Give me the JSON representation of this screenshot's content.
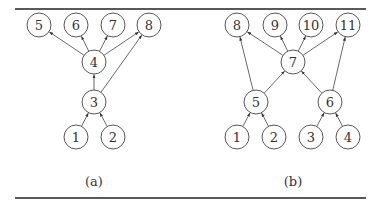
{
  "figure": {
    "rules": {
      "top_y": 9,
      "bottom_y": 198,
      "x1": 15,
      "x2": 366
    },
    "node_radius": 12,
    "panels": [
      {
        "id": "a",
        "caption": "(a)",
        "caption_pos": [
          94,
          186
        ],
        "nodes": [
          {
            "id": "5",
            "label": "5",
            "x": 39,
            "y": 25
          },
          {
            "id": "6",
            "label": "6",
            "x": 76,
            "y": 25
          },
          {
            "id": "7",
            "label": "7",
            "x": 113,
            "y": 25
          },
          {
            "id": "8",
            "label": "8",
            "x": 149,
            "y": 25
          },
          {
            "id": "4",
            "label": "4",
            "x": 94,
            "y": 62
          },
          {
            "id": "3",
            "label": "3",
            "x": 94,
            "y": 102
          },
          {
            "id": "1",
            "label": "1",
            "x": 76,
            "y": 137
          },
          {
            "id": "2",
            "label": "2",
            "x": 113,
            "y": 137
          }
        ],
        "edges": [
          {
            "from": "1",
            "to": "3"
          },
          {
            "from": "2",
            "to": "3"
          },
          {
            "from": "3",
            "to": "4"
          },
          {
            "from": "3",
            "to": "8"
          },
          {
            "from": "4",
            "to": "5"
          },
          {
            "from": "4",
            "to": "6"
          },
          {
            "from": "4",
            "to": "7"
          },
          {
            "from": "4",
            "to": "8"
          }
        ]
      },
      {
        "id": "b",
        "caption": "(b)",
        "caption_pos": [
          293,
          186
        ],
        "nodes": [
          {
            "id": "8",
            "label": "8",
            "x": 237,
            "y": 25
          },
          {
            "id": "9",
            "label": "9",
            "x": 275,
            "y": 25
          },
          {
            "id": "10",
            "label": "10",
            "x": 311,
            "y": 25
          },
          {
            "id": "11",
            "label": "11",
            "x": 348,
            "y": 25
          },
          {
            "id": "7",
            "label": "7",
            "x": 293,
            "y": 62
          },
          {
            "id": "5",
            "label": "5",
            "x": 256,
            "y": 102
          },
          {
            "id": "6",
            "label": "6",
            "x": 330,
            "y": 102
          },
          {
            "id": "1",
            "label": "1",
            "x": 237,
            "y": 137
          },
          {
            "id": "2",
            "label": "2",
            "x": 274,
            "y": 137
          },
          {
            "id": "3",
            "label": "3",
            "x": 311,
            "y": 137
          },
          {
            "id": "4",
            "label": "4",
            "x": 348,
            "y": 137
          }
        ],
        "edges": [
          {
            "from": "1",
            "to": "5"
          },
          {
            "from": "2",
            "to": "5"
          },
          {
            "from": "3",
            "to": "6"
          },
          {
            "from": "4",
            "to": "6"
          },
          {
            "from": "5",
            "to": "7"
          },
          {
            "from": "6",
            "to": "7"
          },
          {
            "from": "5",
            "to": "8"
          },
          {
            "from": "6",
            "to": "11"
          },
          {
            "from": "7",
            "to": "8"
          },
          {
            "from": "7",
            "to": "9"
          },
          {
            "from": "7",
            "to": "10"
          },
          {
            "from": "7",
            "to": "11"
          }
        ]
      }
    ]
  }
}
